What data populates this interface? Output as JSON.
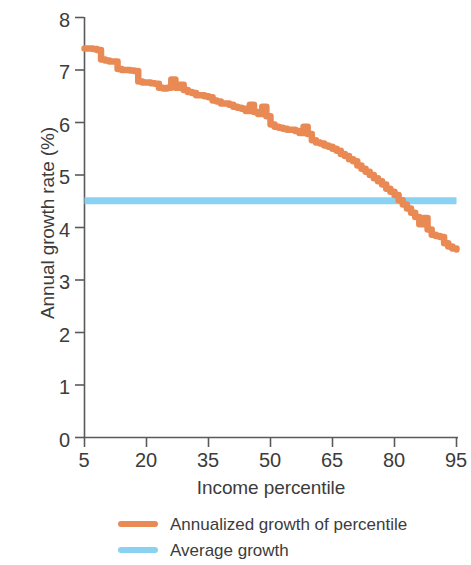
{
  "chart_data": {
    "type": "line",
    "title": "",
    "xlabel": "Income percentile",
    "ylabel": "Annual growth rate (%)",
    "xlim": [
      5,
      95
    ],
    "ylim": [
      0,
      8
    ],
    "xticks": [
      5,
      20,
      35,
      50,
      65,
      80,
      95
    ],
    "yticks": [
      0,
      1,
      2,
      3,
      4,
      5,
      6,
      7,
      8
    ],
    "grid": false,
    "legend_position": "below-axes",
    "line_style": "step",
    "colors": {
      "percentile_growth": "#E98A55",
      "average_growth": "#8AD2F2",
      "axis": "#5a5a5a",
      "text": "#3c3c3c",
      "background": "#ffffff"
    },
    "series": [
      {
        "name": "Annualized growth of percentile",
        "color": "#E98A55",
        "x": [
          5,
          6,
          7,
          8,
          9,
          10,
          11,
          12,
          13,
          14,
          15,
          16,
          17,
          18,
          19,
          20,
          21,
          22,
          23,
          24,
          25,
          26,
          27,
          28,
          29,
          30,
          31,
          32,
          33,
          34,
          35,
          36,
          37,
          38,
          39,
          40,
          41,
          42,
          43,
          44,
          45,
          46,
          47,
          48,
          49,
          50,
          51,
          52,
          53,
          54,
          55,
          56,
          57,
          58,
          59,
          60,
          61,
          62,
          63,
          64,
          65,
          66,
          67,
          68,
          69,
          70,
          71,
          72,
          73,
          74,
          75,
          76,
          77,
          78,
          79,
          80,
          81,
          82,
          83,
          84,
          85,
          86,
          87,
          88,
          89,
          90,
          91,
          92,
          93,
          94,
          95
        ],
        "y": [
          7.41,
          7.41,
          7.4,
          7.38,
          7.2,
          7.18,
          7.16,
          7.16,
          7.02,
          7.0,
          7.0,
          6.99,
          6.98,
          6.78,
          6.76,
          6.76,
          6.75,
          6.74,
          6.66,
          6.65,
          6.66,
          6.82,
          6.66,
          6.72,
          6.62,
          6.58,
          6.56,
          6.52,
          6.52,
          6.5,
          6.48,
          6.42,
          6.4,
          6.36,
          6.36,
          6.34,
          6.3,
          6.28,
          6.26,
          6.22,
          6.34,
          6.2,
          6.16,
          6.3,
          6.12,
          5.96,
          5.92,
          5.9,
          5.88,
          5.86,
          5.86,
          5.84,
          5.8,
          5.92,
          5.78,
          5.66,
          5.62,
          5.6,
          5.56,
          5.54,
          5.5,
          5.46,
          5.4,
          5.36,
          5.3,
          5.26,
          5.18,
          5.12,
          5.06,
          5.0,
          4.94,
          4.88,
          4.82,
          4.74,
          4.68,
          4.62,
          4.52,
          4.44,
          4.36,
          4.28,
          4.2,
          4.06,
          4.18,
          3.96,
          3.86,
          3.84,
          3.82,
          3.7,
          3.64,
          3.6,
          3.58
        ]
      },
      {
        "name": "Average growth",
        "color": "#8AD2F2",
        "x": [
          5,
          95
        ],
        "y": [
          4.51,
          4.51
        ],
        "constant_value": 4.51
      }
    ],
    "annotations": []
  },
  "axes": {
    "y_title": "Annual growth rate (%)",
    "x_title": "Income percentile",
    "y_tick_labels": [
      "8",
      "7",
      "6",
      "5",
      "4",
      "3",
      "2",
      "1",
      "0"
    ],
    "x_tick_labels": [
      "5",
      "20",
      "35",
      "50",
      "65",
      "80",
      "95"
    ]
  },
  "legend": {
    "items": [
      {
        "label": "Annualized growth of percentile",
        "color": "#E98A55"
      },
      {
        "label": "Average growth",
        "color": "#8AD2F2"
      }
    ]
  }
}
